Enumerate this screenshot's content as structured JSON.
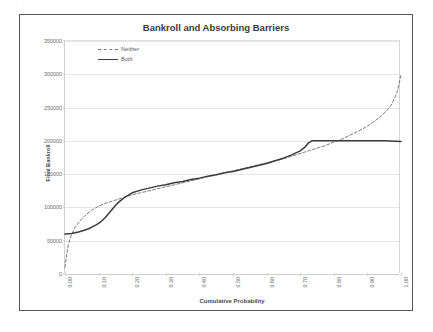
{
  "ghost_text": "· · ·   · · ·    · ·   · ·   · ·  · · ·   · ·   · · ·   · ·",
  "chart": {
    "title": "Bankroll and Absorbing Barriers",
    "xlabel": "Cumulative Probability",
    "ylabel": "Final Bankroll",
    "ytick_labels": [
      "0",
      "50000",
      "100000",
      "150000",
      "200000",
      "250000",
      "300000",
      "350000"
    ],
    "xtick_labels": [
      "0.00",
      "0.10",
      "0.20",
      "0.30",
      "0.40",
      "0.50",
      "0.60",
      "0.70",
      "0.80",
      "0.90",
      "1.00"
    ],
    "legend": [
      {
        "label": "Neither",
        "style": "dashed"
      },
      {
        "label": "Both",
        "style": "solid"
      }
    ]
  },
  "chart_data": {
    "type": "line",
    "title": "Bankroll and Absorbing Barriers",
    "xlabel": "Cumulative Probability",
    "ylabel": "Final Bankroll",
    "xlim": [
      0.0,
      1.0
    ],
    "ylim": [
      0,
      350000
    ],
    "xticks": [
      0.0,
      0.1,
      0.2,
      0.3,
      0.4,
      0.5,
      0.6,
      0.7,
      0.8,
      0.9,
      1.0
    ],
    "yticks": [
      0,
      50000,
      100000,
      150000,
      200000,
      250000,
      300000,
      350000
    ],
    "grid": "horizontal",
    "legend_position": "upper-left-inside",
    "annotations": [
      "Solid 'Both' series is clipped by a lower absorbing barrier near 60000 and an upper absorbing barrier at 200000.",
      "Dashed 'Neither' series is unbounded: it falls toward 10000 at probability 0.00 and rises to about 300000 at probability 1.00."
    ],
    "series": [
      {
        "name": "Neither",
        "style": "dashed",
        "color": "#7c7c80",
        "x": [
          0.0,
          0.005,
          0.01,
          0.02,
          0.03,
          0.045,
          0.06,
          0.08,
          0.1,
          0.125,
          0.15,
          0.175,
          0.2,
          0.225,
          0.25,
          0.275,
          0.3,
          0.325,
          0.35,
          0.375,
          0.4,
          0.425,
          0.45,
          0.475,
          0.5,
          0.525,
          0.55,
          0.575,
          0.6,
          0.625,
          0.65,
          0.675,
          0.7,
          0.725,
          0.75,
          0.775,
          0.8,
          0.825,
          0.85,
          0.875,
          0.9,
          0.92,
          0.94,
          0.955,
          0.97,
          0.98,
          0.988,
          0.994,
          1.0
        ],
        "y": [
          10000,
          30000,
          45000,
          60000,
          70000,
          80000,
          88000,
          96000,
          102000,
          107000,
          111000,
          115000,
          119000,
          122000,
          125000,
          128000,
          131000,
          134000,
          137000,
          140000,
          143000,
          146000,
          149000,
          152000,
          155000,
          158000,
          161000,
          164000,
          167000,
          170000,
          173000,
          177000,
          181000,
          185000,
          189000,
          193000,
          198000,
          203000,
          209000,
          215000,
          222000,
          229000,
          237000,
          244000,
          253000,
          263000,
          273000,
          285000,
          300000
        ]
      },
      {
        "name": "Both",
        "style": "solid",
        "color": "#3b3b3e",
        "x": [
          0.0,
          0.01,
          0.02,
          0.03,
          0.04,
          0.05,
          0.06,
          0.07,
          0.08,
          0.09,
          0.1,
          0.11,
          0.12,
          0.13,
          0.14,
          0.15,
          0.16,
          0.17,
          0.18,
          0.19,
          0.2,
          0.225,
          0.25,
          0.275,
          0.3,
          0.325,
          0.35,
          0.375,
          0.4,
          0.425,
          0.45,
          0.475,
          0.5,
          0.525,
          0.55,
          0.575,
          0.6,
          0.625,
          0.65,
          0.675,
          0.7,
          0.715,
          0.725,
          0.735,
          0.75,
          0.8,
          0.85,
          0.9,
          0.95,
          1.0
        ],
        "y": [
          60000,
          60500,
          61000,
          62000,
          63000,
          64500,
          66000,
          68000,
          70500,
          73000,
          76000,
          80000,
          85000,
          91000,
          97000,
          103000,
          108000,
          112000,
          116000,
          119000,
          122000,
          126000,
          129000,
          132000,
          134000,
          137000,
          139000,
          142000,
          144000,
          147000,
          149000,
          152000,
          154000,
          157000,
          160000,
          163000,
          166000,
          170000,
          174000,
          179000,
          185000,
          191000,
          197000,
          200000,
          200000,
          200000,
          200000,
          200000,
          200000,
          199000
        ]
      }
    ]
  }
}
